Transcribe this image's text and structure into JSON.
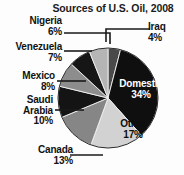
{
  "chart_data": {
    "type": "pie",
    "title": "Sources of U.S. Oil, 2008",
    "xlabel": "",
    "ylabel": "",
    "legend_position": "none",
    "grid": false,
    "categories": [
      "Iraq",
      "Domestic",
      "Other",
      "Canada",
      "Saudi Arabia",
      "Mexico",
      "Venezuela",
      "Nigeria"
    ],
    "values": [
      4,
      34,
      17,
      13,
      10,
      8,
      7,
      6
    ],
    "units": "percent",
    "slices": [
      {
        "label": "Iraq",
        "value": 4,
        "value_text": "4%",
        "color": "#4a4a4a",
        "label_placement": "outside"
      },
      {
        "label": "Domestic",
        "value": 34,
        "value_text": "34%",
        "color": "#0f0f0f",
        "label_placement": "inside"
      },
      {
        "label": "Other",
        "value": 17,
        "value_text": "17%",
        "color": "#d2d2d2",
        "label_placement": "inside"
      },
      {
        "label": "Canada",
        "value": 13,
        "value_text": "13%",
        "color": "#868686",
        "label_placement": "outside"
      },
      {
        "label": "Saudi Arabia",
        "value": 10,
        "value_text": "10%",
        "color": "#141414",
        "label_placement": "outside"
      },
      {
        "label": "Mexico",
        "value": 8,
        "value_text": "8%",
        "color": "#8d8d8d",
        "label_placement": "outside"
      },
      {
        "label": "Venezuela",
        "value": 7,
        "value_text": "7%",
        "color": "#161616",
        "label_placement": "outside"
      },
      {
        "label": "Nigeria",
        "value": 6,
        "value_text": "6%",
        "color": "#b5b5b5",
        "label_placement": "outside"
      }
    ]
  },
  "labels": {
    "iraq": {
      "name": "Iraq",
      "value": "4%"
    },
    "nigeria": {
      "name": "Nigeria",
      "value": "6%"
    },
    "venezuela": {
      "name": "Venezuela",
      "value": "7%"
    },
    "mexico": {
      "name": "Mexico",
      "value": "8%"
    },
    "saudi_line1": {
      "name": "Saudi"
    },
    "saudi_line2": {
      "name": "Arabia",
      "value": "10%"
    },
    "canada": {
      "name": "Canada",
      "value": "13%"
    },
    "domestic": {
      "name": "Domestic",
      "value": "34%"
    },
    "other": {
      "name": "Other",
      "value": "17%"
    }
  },
  "colors": {
    "background": "#fdfdfd",
    "text": "#121212",
    "leader_line": "#1a1a1a",
    "pie_outline": "#2b2b2b"
  }
}
